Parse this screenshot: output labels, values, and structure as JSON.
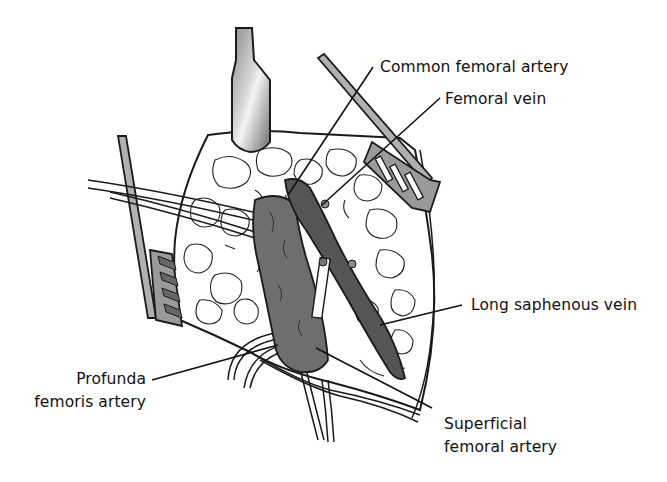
{
  "figure": {
    "colors": {
      "background": "#ffffff",
      "vessel_fill": "#6e6e6e",
      "vessel_dark": "#555555",
      "fat_fill": "#ffffff",
      "outline": "#1a1a1a",
      "retractor_fill": "#9a9a9a",
      "label_text": "#111111"
    },
    "labels": {
      "common_femoral_artery": "Common femoral artery",
      "femoral_vein": "Femoral vein",
      "long_saphenous_vein": "Long saphenous vein",
      "profunda_line1": "Profunda",
      "profunda_line2": "femoris artery",
      "superficial_line1": "Superficial",
      "superficial_line2": "femoral artery"
    }
  }
}
